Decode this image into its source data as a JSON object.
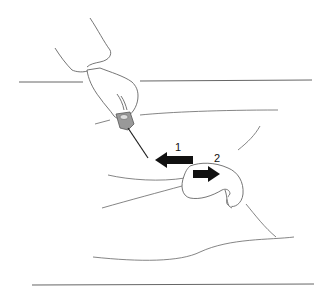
{
  "diagram": {
    "type": "medical-procedure-illustration",
    "labels": [
      {
        "id": "step-1",
        "text": "1"
      },
      {
        "id": "step-2",
        "text": "2"
      }
    ],
    "arrows": [
      {
        "id": "arrow-1",
        "direction": "left",
        "color": "#111111"
      },
      {
        "id": "arrow-2",
        "direction": "right",
        "color": "#111111"
      }
    ],
    "colors": {
      "line": "#555555",
      "arrow": "#111111",
      "instrument_grip": "#999999",
      "background": "#ffffff"
    }
  }
}
